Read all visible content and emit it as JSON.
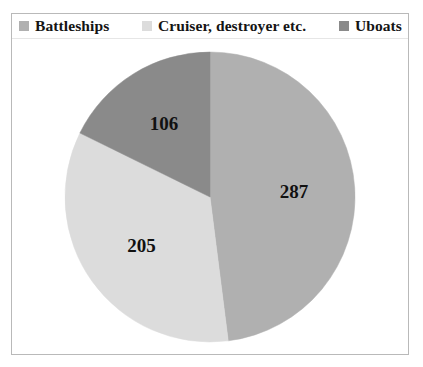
{
  "chart_data": {
    "type": "pie",
    "title": "",
    "categories": [
      "Battleships",
      "Cruiser, destroyer etc.",
      "Uboats"
    ],
    "values": [
      287,
      205,
      106
    ],
    "labels": [
      "287",
      "205",
      "106"
    ],
    "total": 598,
    "colors": [
      "#b0b0b0",
      "#dcdcdc",
      "#8a8a8a"
    ],
    "legend_position": "top",
    "grid": false,
    "start_angle_deg": 0,
    "direction": "clockwise"
  },
  "legend": {
    "items": [
      {
        "label": "Battleships",
        "color": "#b0b0b0",
        "swatch_icon": "square-swatch-icon"
      },
      {
        "label": "Cruiser, destroyer etc.",
        "color": "#dcdcdc",
        "swatch_icon": "square-swatch-icon"
      },
      {
        "label": "Uboats",
        "color": "#8a8a8a",
        "swatch_icon": "square-swatch-icon"
      }
    ]
  },
  "pie": {
    "slices": [
      {
        "name": "Battleships",
        "value_label": "287",
        "color": "#b0b0b0"
      },
      {
        "name": "Cruiser, destroyer etc.",
        "value_label": "205",
        "color": "#dcdcdc"
      },
      {
        "name": "Uboats",
        "value_label": "106",
        "color": "#8a8a8a"
      }
    ]
  },
  "frame": {
    "border_color": "#b9b9b9",
    "background": "#ffffff"
  }
}
